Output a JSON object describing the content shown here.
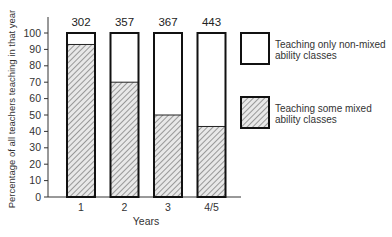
{
  "chart_data": {
    "type": "bar",
    "stacked": true,
    "title": "",
    "xlabel": "Years",
    "ylabel": "Percentage of all teachers teaching in that year",
    "ylim": [
      0,
      100
    ],
    "yticks": [
      0,
      10,
      20,
      30,
      40,
      50,
      60,
      70,
      80,
      90,
      100
    ],
    "ytick_labels": [
      "0",
      "10",
      "20",
      "30",
      "40",
      "50",
      "60",
      "70",
      "80",
      "90",
      "100"
    ],
    "categories": [
      "1",
      "2",
      "3",
      "4/5"
    ],
    "bar_counts": [
      "302",
      "357",
      "367",
      "443"
    ],
    "series": [
      {
        "name": "Teaching some mixed ability classes",
        "pattern": "hatched",
        "values": [
          93,
          70,
          50,
          43
        ]
      },
      {
        "name": "Teaching only non-mixed ability classes",
        "pattern": "blank",
        "values": [
          7,
          30,
          50,
          57
        ]
      }
    ],
    "legend": {
      "placement": "right",
      "entries": [
        {
          "pattern": "blank",
          "lines": [
            "Teaching only non-mixed",
            "ability classes"
          ]
        },
        {
          "pattern": "hatched",
          "lines": [
            "Teaching some mixed",
            "ability classes"
          ]
        }
      ]
    },
    "grid": false
  }
}
